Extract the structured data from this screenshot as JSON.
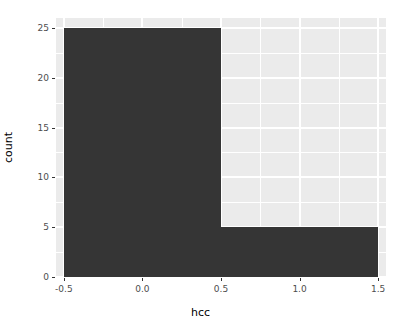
{
  "chart_data": {
    "type": "bar",
    "title": "",
    "subtitle": "",
    "xlabel": "hcc",
    "ylabel": "count",
    "categories": [
      "0",
      "1"
    ],
    "values": [
      25,
      5
    ],
    "bins": [
      {
        "label": "0",
        "x_start": -0.5,
        "x_end": 0.5,
        "count": 25
      },
      {
        "label": "1",
        "x_start": 0.5,
        "x_end": 1.5,
        "count": 5
      }
    ],
    "xlim": [
      -0.55,
      1.55
    ],
    "ylim": [
      0,
      26
    ],
    "x_ticks": [
      "-0.5",
      "0.0",
      "0.5",
      "1.0",
      "1.5"
    ],
    "x_tick_values": [
      -0.5,
      0.0,
      0.5,
      1.0,
      1.5
    ],
    "y_ticks": [
      "0",
      "5",
      "10",
      "15",
      "20",
      "25"
    ],
    "y_tick_values": [
      0,
      5,
      10,
      15,
      20,
      25
    ],
    "grid": true,
    "legend": "none",
    "colors": {
      "bar_fill": "#353535",
      "panel_background": "#ebebeb",
      "gridline": "#ffffff",
      "axis_text": "#4d4d4d",
      "axis_title": "#000000",
      "plot_background": "#ffffff"
    }
  },
  "axes": {
    "x": {
      "title": "hcc",
      "ticks": [
        {
          "label": "-0.5"
        },
        {
          "label": "0.0"
        },
        {
          "label": "0.5"
        },
        {
          "label": "1.0"
        },
        {
          "label": "1.5"
        }
      ]
    },
    "y": {
      "title": "count",
      "ticks": [
        {
          "label": "0"
        },
        {
          "label": "5"
        },
        {
          "label": "10"
        },
        {
          "label": "15"
        },
        {
          "label": "20"
        },
        {
          "label": "25"
        }
      ]
    }
  }
}
